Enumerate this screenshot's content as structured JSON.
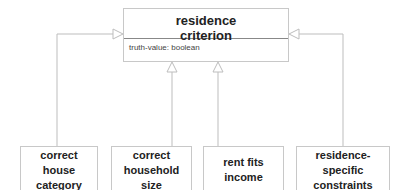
{
  "diagram": {
    "type": "uml-class-generalization",
    "parent": {
      "title_line1": "residence",
      "title_line2": "criterion",
      "attribute": "truth-value: boolean"
    },
    "children": [
      {
        "line1": "correct",
        "line2": "house category"
      },
      {
        "line1": "correct",
        "line2": "household size"
      },
      {
        "line1": "rent fits",
        "line2": "income"
      },
      {
        "line1": "residence-specific",
        "line2": "constraints"
      }
    ],
    "colors": {
      "line": "#bdbdbd",
      "box_border": "#c8c8c8",
      "text": "#222222"
    }
  }
}
